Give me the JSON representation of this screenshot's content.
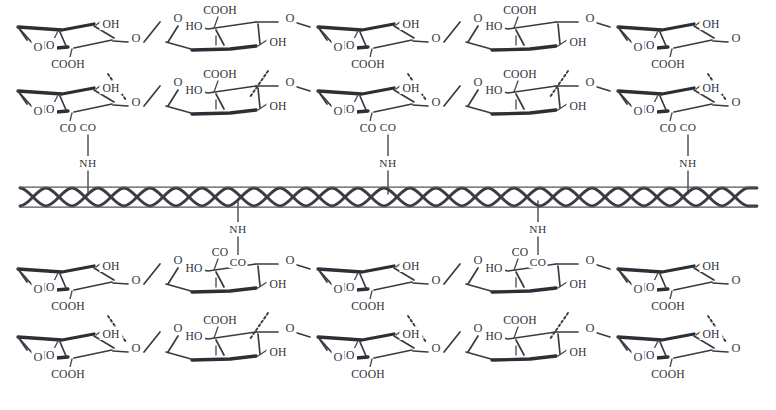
{
  "figure": {
    "background_color": "#ffffff",
    "ink_color": "#3a3a42",
    "width": 776,
    "height": 410
  },
  "labels": {
    "hydroxyl": "OH",
    "hydroxyl_left": "HO",
    "carboxyl": "COOH",
    "carbonyl": "CO",
    "amide_nh": "NH",
    "ring_oxygen": "O",
    "glycosidic_oxygen": "O"
  },
  "fiber": {
    "name": "fiber-substrate",
    "x_start": 20,
    "x_end": 757,
    "y_center": 197,
    "strand_count": 2,
    "weave_period": 52,
    "weave_amplitude": 9
  },
  "chains": [
    {
      "id": "chain-1",
      "row": 1,
      "y_base": 46,
      "position": "above-fiber-outer",
      "x_start": 16,
      "units": [
        {
          "type": "A",
          "x": 16,
          "substituents": [
            "HO",
            "OH",
            "COOH",
            "O"
          ]
        },
        {
          "type": "B",
          "x": 166,
          "substituents": [
            "O",
            "HO",
            "COOH",
            "OH"
          ]
        },
        {
          "type": "A",
          "x": 316,
          "substituents": [
            "HO",
            "OH",
            "COOH",
            "O"
          ]
        },
        {
          "type": "B",
          "x": 466,
          "substituents": [
            "O",
            "HO",
            "COOH",
            "OH"
          ]
        },
        {
          "type": "A",
          "x": 616,
          "substituents": [
            "HO",
            "OH",
            "COOH",
            "O"
          ]
        }
      ]
    },
    {
      "id": "chain-2",
      "row": 2,
      "y_base": 110,
      "position": "above-fiber-inner",
      "x_start": 16,
      "units": [
        {
          "type": "A",
          "x": 16,
          "substituents": [
            "HO",
            "OH",
            "CO",
            "O"
          ],
          "grafted": true
        },
        {
          "type": "B",
          "x": 166,
          "substituents": [
            "O",
            "HO",
            "COOH",
            "OH"
          ],
          "grafted": false
        },
        {
          "type": "A",
          "x": 316,
          "substituents": [
            "HO",
            "OH",
            "CO",
            "O"
          ],
          "grafted": true
        },
        {
          "type": "B",
          "x": 466,
          "substituents": [
            "O",
            "HO",
            "COOH",
            "OH"
          ],
          "grafted": false
        },
        {
          "type": "A",
          "x": 616,
          "substituents": [
            "HO",
            "OH",
            "CO",
            "O"
          ],
          "grafted": true
        }
      ]
    },
    {
      "id": "chain-3",
      "row": 3,
      "y_base": 288,
      "position": "below-fiber-inner",
      "x_start": 16,
      "units": [
        {
          "type": "A",
          "x": 16,
          "substituents": [
            "HO",
            "OH",
            "COOH",
            "O"
          ],
          "grafted": false
        },
        {
          "type": "B",
          "x": 166,
          "substituents": [
            "O",
            "HO",
            "CO",
            "OH"
          ],
          "grafted": true
        },
        {
          "type": "A",
          "x": 316,
          "substituents": [
            "HO",
            "OH",
            "COOH",
            "O"
          ],
          "grafted": false
        },
        {
          "type": "B",
          "x": 466,
          "substituents": [
            "O",
            "HO",
            "CO",
            "OH"
          ],
          "grafted": true
        },
        {
          "type": "A",
          "x": 616,
          "substituents": [
            "HO",
            "OH",
            "COOH",
            "O"
          ],
          "grafted": false
        }
      ]
    },
    {
      "id": "chain-4",
      "row": 4,
      "y_base": 356,
      "position": "below-fiber-outer",
      "x_start": 16,
      "units": [
        {
          "type": "A",
          "x": 16,
          "substituents": [
            "HO",
            "OH",
            "COOH",
            "O"
          ]
        },
        {
          "type": "B",
          "x": 166,
          "substituents": [
            "O",
            "HO",
            "COOH",
            "OH"
          ]
        },
        {
          "type": "A",
          "x": 316,
          "substituents": [
            "HO",
            "OH",
            "COOH",
            "O"
          ]
        },
        {
          "type": "B",
          "x": 466,
          "substituents": [
            "O",
            "HO",
            "COOH",
            "OH"
          ]
        },
        {
          "type": "A",
          "x": 616,
          "substituents": [
            "HO",
            "OH",
            "COOH",
            "O"
          ]
        }
      ]
    }
  ],
  "graft_linkers": [
    {
      "id": "graft-1",
      "x": 88,
      "side": "above",
      "carbonyl": "CO",
      "amide": "NH",
      "co_y": 131,
      "nh_y": 167
    },
    {
      "id": "graft-2",
      "x": 388,
      "side": "above",
      "carbonyl": "CO",
      "amide": "NH",
      "co_y": 131,
      "nh_y": 167
    },
    {
      "id": "graft-3",
      "x": 688,
      "side": "above",
      "carbonyl": "CO",
      "amide": "NH",
      "co_y": 131,
      "nh_y": 167
    },
    {
      "id": "graft-4",
      "x": 238,
      "side": "below",
      "carbonyl": "CO",
      "amide": "NH",
      "co_y": 266,
      "nh_y": 233
    },
    {
      "id": "graft-5",
      "x": 538,
      "side": "below",
      "carbonyl": "CO",
      "amide": "NH",
      "co_y": 266,
      "nh_y": 233
    }
  ],
  "hydrogen_bonds": [
    {
      "id": "hb-1",
      "between": [
        "chain-1.COOH",
        "chain-2.OH"
      ],
      "x1": 108,
      "y1": 74,
      "x2": 126,
      "y2": 100
    },
    {
      "id": "hb-2",
      "between": [
        "chain-1.OH",
        "chain-2.COOH"
      ],
      "x1": 268,
      "y1": 71,
      "x2": 250,
      "y2": 97
    },
    {
      "id": "hb-3",
      "between": [
        "chain-1.COOH",
        "chain-2.OH"
      ],
      "x1": 408,
      "y1": 74,
      "x2": 426,
      "y2": 100
    },
    {
      "id": "hb-4",
      "between": [
        "chain-1.OH",
        "chain-2.COOH"
      ],
      "x1": 568,
      "y1": 71,
      "x2": 550,
      "y2": 97
    },
    {
      "id": "hb-5",
      "between": [
        "chain-1.COOH",
        "chain-2.OH"
      ],
      "x1": 708,
      "y1": 74,
      "x2": 726,
      "y2": 100
    },
    {
      "id": "hb-6",
      "between": [
        "chain-3.COOH",
        "chain-4.OH"
      ],
      "x1": 108,
      "y1": 316,
      "x2": 126,
      "y2": 342
    },
    {
      "id": "hb-7",
      "between": [
        "chain-3.OH",
        "chain-4.COOH"
      ],
      "x1": 268,
      "y1": 313,
      "x2": 250,
      "y2": 339
    },
    {
      "id": "hb-8",
      "between": [
        "chain-3.COOH",
        "chain-4.OH"
      ],
      "x1": 408,
      "y1": 316,
      "x2": 426,
      "y2": 342
    },
    {
      "id": "hb-9",
      "between": [
        "chain-3.OH",
        "chain-4.COOH"
      ],
      "x1": 568,
      "y1": 313,
      "x2": 550,
      "y2": 339
    },
    {
      "id": "hb-10",
      "between": [
        "chain-3.COOH",
        "chain-4.OH"
      ],
      "x1": 708,
      "y1": 316,
      "x2": 726,
      "y2": 342
    }
  ]
}
